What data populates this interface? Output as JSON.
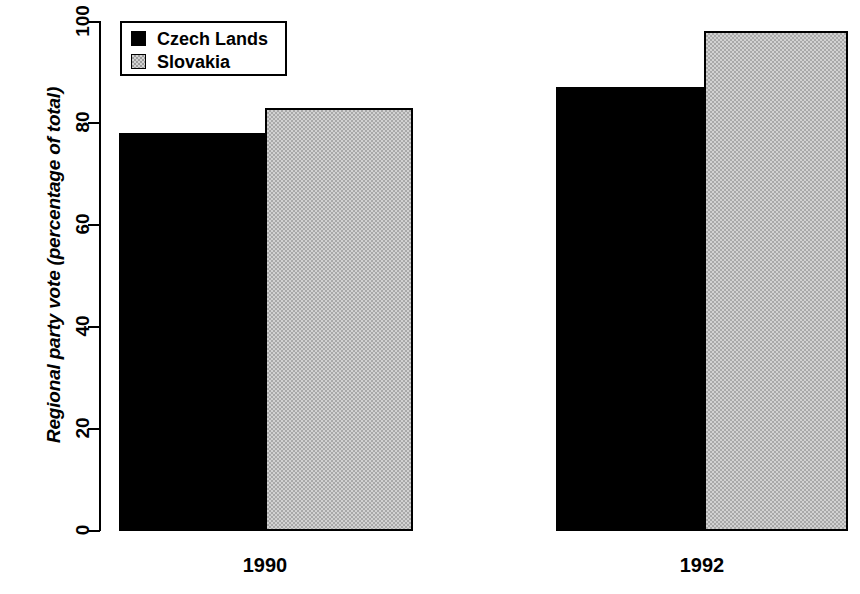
{
  "chart_data": {
    "type": "bar",
    "title": "",
    "subtitle": "",
    "xlabel": "",
    "ylabel": "Regional party vote (percentage of total)",
    "categories": [
      "1990",
      "1992"
    ],
    "series": [
      {
        "name": "Czech Lands",
        "color": "#000000",
        "values": [
          78,
          87
        ]
      },
      {
        "name": "Slovakia",
        "color": "#d2d2d2",
        "values": [
          83,
          98
        ]
      }
    ],
    "ylim": [
      0,
      100
    ],
    "yticks": [
      0,
      20,
      40,
      60,
      80,
      100
    ],
    "ytick_labels": [
      "0",
      "20",
      "40",
      "60",
      "80",
      "100"
    ],
    "grid": false,
    "legend_position": "top-left",
    "bars_adjacent": true,
    "annotations": []
  },
  "legend": {
    "items": [
      {
        "label": "Czech Lands",
        "swatch": "black-square-icon"
      },
      {
        "label": "Slovakia",
        "swatch": "gray-square-icon"
      }
    ]
  },
  "axes": {
    "y": {
      "title": "Regional party vote (percentage of total)",
      "ticks": [
        "0",
        "20",
        "40",
        "60",
        "80",
        "100"
      ]
    },
    "x": {
      "groups": [
        "1990",
        "1992"
      ]
    }
  }
}
